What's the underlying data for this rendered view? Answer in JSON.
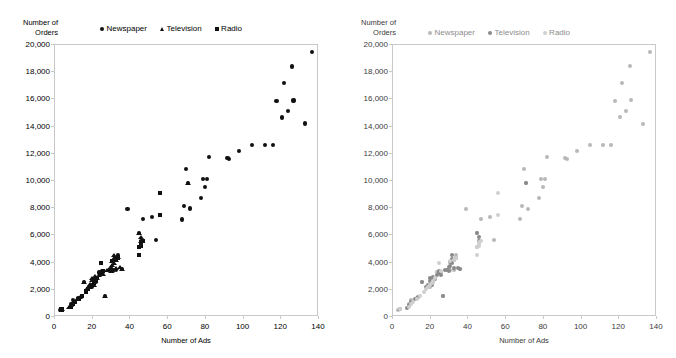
{
  "figure": {
    "panel_count": 2,
    "width": 676,
    "height": 358
  },
  "panels": [
    {
      "id": "left-panel",
      "style": "high-contrast-black-markers",
      "ytitle": "Number of\nOrders",
      "xtitle": "Number of Ads",
      "legend": [
        {
          "label": "Newspaper",
          "marker": "circle",
          "color": "#111111"
        },
        {
          "label": "Television",
          "marker": "triangle",
          "color": "#111111"
        },
        {
          "label": "Radio",
          "marker": "square",
          "color": "#111111"
        }
      ],
      "yticks": [
        "0",
        "2,000",
        "4,000",
        "6,000",
        "8,000",
        "10,000",
        "12,000",
        "14,000",
        "16,000",
        "18,000",
        "20,000"
      ],
      "xticks": [
        "0",
        "20",
        "40",
        "60",
        "80",
        "100",
        "120",
        "140"
      ]
    },
    {
      "id": "right-panel",
      "style": "low-contrast-grey-circles",
      "ytitle": "Number of\nOrders",
      "xtitle": "Number of Ads",
      "legend": [
        {
          "label": "Newspaper",
          "marker": "circle",
          "color": "#b8b8b8"
        },
        {
          "label": "Television",
          "marker": "circle",
          "color": "#8a8a8a"
        },
        {
          "label": "Radio",
          "marker": "circle",
          "color": "#cfcfcf"
        }
      ],
      "yticks": [
        "0",
        "2,000",
        "4,000",
        "6,000",
        "8,000",
        "10,000",
        "12,000",
        "14,000",
        "16,000",
        "18,000",
        "20,000"
      ],
      "xticks": [
        "0",
        "20",
        "40",
        "60",
        "80",
        "100",
        "120",
        "140"
      ]
    }
  ],
  "chart_data": {
    "type": "scatter",
    "title": "",
    "xlabel": "Number of Ads",
    "ylabel": "Number of Orders",
    "xlim": [
      0,
      140
    ],
    "ylim": [
      0,
      20000
    ],
    "xticks": [
      0,
      20,
      40,
      60,
      80,
      100,
      120,
      140
    ],
    "yticks": [
      0,
      2000,
      4000,
      6000,
      8000,
      10000,
      12000,
      14000,
      16000,
      18000,
      20000
    ],
    "grid": false,
    "legend_position": "top-center",
    "panel_note": "Same data plotted twice: left panel uses distinct black marker shapes per series; right panel uses grey-scale circles only.",
    "series": [
      {
        "name": "Newspaper",
        "marker_left": "circle",
        "marker_right": "circle",
        "color_left": "#111111",
        "color_right": "#b8b8b8",
        "points": [
          [
            3,
            450
          ],
          [
            9,
            700
          ],
          [
            9,
            900
          ],
          [
            10,
            1150
          ],
          [
            13,
            1300
          ],
          [
            16,
            2500
          ],
          [
            20,
            2150
          ],
          [
            21,
            2400
          ],
          [
            22,
            2500
          ],
          [
            24,
            3200
          ],
          [
            26,
            3250
          ],
          [
            27,
            1450
          ],
          [
            31,
            3350
          ],
          [
            33,
            3400
          ],
          [
            34,
            4450
          ],
          [
            36,
            3450
          ],
          [
            39,
            7850
          ],
          [
            45,
            5100
          ],
          [
            45,
            6100
          ],
          [
            46,
            5500
          ],
          [
            47,
            7150
          ],
          [
            52,
            7250
          ],
          [
            54,
            5600
          ],
          [
            68,
            7100
          ],
          [
            69,
            8100
          ],
          [
            70,
            10800
          ],
          [
            71,
            9750
          ],
          [
            72,
            7900
          ],
          [
            78,
            8650
          ],
          [
            79,
            10100
          ],
          [
            80,
            9500
          ],
          [
            81,
            10100
          ],
          [
            82,
            11700
          ],
          [
            92,
            11600
          ],
          [
            93,
            11550
          ],
          [
            98,
            12150
          ],
          [
            105,
            12550
          ],
          [
            112,
            12550
          ],
          [
            116,
            12550
          ],
          [
            118,
            15800
          ],
          [
            121,
            14600
          ],
          [
            122,
            17150
          ],
          [
            124,
            15050
          ],
          [
            126,
            18350
          ],
          [
            127,
            15850
          ],
          [
            133,
            14150
          ],
          [
            137,
            19400
          ]
        ]
      },
      {
        "name": "Television",
        "marker_left": "triangle",
        "marker_right": "circle",
        "color_left": "#111111",
        "color_right": "#8a8a8a",
        "points": [
          [
            4,
            500
          ],
          [
            8,
            620
          ],
          [
            9,
            780
          ],
          [
            10,
            1000
          ],
          [
            12,
            1250
          ],
          [
            14,
            1400
          ],
          [
            16,
            2500
          ],
          [
            18,
            2100
          ],
          [
            19,
            2300
          ],
          [
            20,
            2600
          ],
          [
            20,
            2800
          ],
          [
            21,
            2250
          ],
          [
            21,
            2700
          ],
          [
            22,
            2900
          ],
          [
            23,
            2750
          ],
          [
            24,
            3000
          ],
          [
            25,
            3150
          ],
          [
            25,
            3300
          ],
          [
            26,
            3050
          ],
          [
            27,
            1450
          ],
          [
            28,
            3350
          ],
          [
            29,
            3400
          ],
          [
            30,
            3300
          ],
          [
            30,
            3600
          ],
          [
            31,
            3700
          ],
          [
            31,
            4000
          ],
          [
            32,
            3900
          ],
          [
            32,
            4200
          ],
          [
            32,
            4450
          ],
          [
            33,
            3500
          ],
          [
            33,
            4100
          ],
          [
            34,
            4300
          ],
          [
            35,
            3550
          ],
          [
            36,
            3450
          ],
          [
            45,
            6100
          ],
          [
            46,
            5800
          ],
          [
            46,
            5500
          ],
          [
            71,
            9750
          ]
        ]
      },
      {
        "name": "Radio",
        "marker_left": "square",
        "marker_right": "circle",
        "color_left": "#111111",
        "color_right": "#cfcfcf",
        "points": [
          [
            4,
            480
          ],
          [
            9,
            650
          ],
          [
            10,
            900
          ],
          [
            11,
            1050
          ],
          [
            13,
            1250
          ],
          [
            15,
            1500
          ],
          [
            17,
            1800
          ],
          [
            18,
            2000
          ],
          [
            19,
            2150
          ],
          [
            20,
            2300
          ],
          [
            21,
            2450
          ],
          [
            22,
            2600
          ],
          [
            23,
            2800
          ],
          [
            25,
            3900
          ],
          [
            26,
            3300
          ],
          [
            31,
            4050
          ],
          [
            33,
            4150
          ],
          [
            34,
            4250
          ],
          [
            45,
            4500
          ],
          [
            45,
            5050
          ],
          [
            46,
            5150
          ],
          [
            46,
            5300
          ],
          [
            46,
            5450
          ],
          [
            47,
            5500
          ],
          [
            56,
            9050
          ],
          [
            56,
            7450
          ]
        ]
      }
    ]
  }
}
